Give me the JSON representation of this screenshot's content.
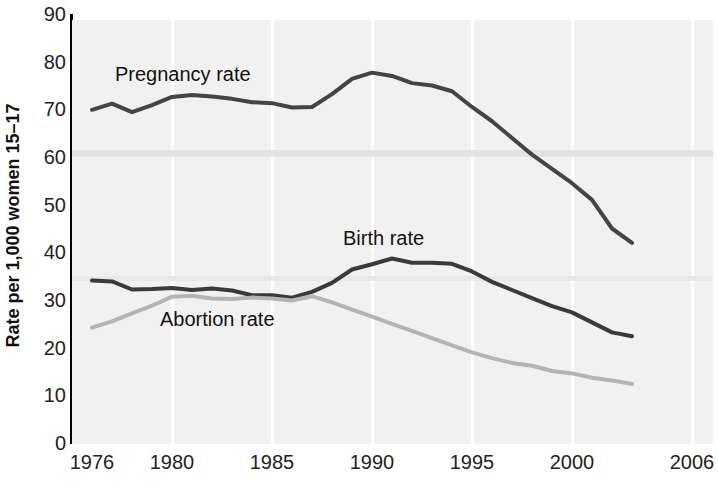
{
  "chart_data": {
    "type": "line",
    "title": "",
    "subtitle": "",
    "xlabel": "",
    "ylabel": "Rate per 1,000 women 15–17",
    "xlim": [
      1976,
      2006
    ],
    "ylim": [
      0,
      90
    ],
    "grid": "vertical-white-gridlines-at-x-ticks",
    "legend": "inline-labels-on-plot",
    "x_tick_labels": [
      "1976",
      "1980",
      "1985",
      "1990",
      "1995",
      "2000",
      "2006"
    ],
    "x_tick_values": [
      1976,
      1980,
      1985,
      1990,
      1995,
      2000,
      2006
    ],
    "y_tick_labels": [
      "0",
      "10",
      "20",
      "30",
      "40",
      "50",
      "60",
      "70",
      "80",
      "90"
    ],
    "y_tick_values": [
      0,
      10,
      20,
      30,
      40,
      50,
      60,
      70,
      80,
      90
    ],
    "x": [
      1976,
      1977,
      1978,
      1979,
      1980,
      1981,
      1982,
      1983,
      1984,
      1985,
      1986,
      1987,
      1988,
      1989,
      1990,
      1991,
      1992,
      1993,
      1994,
      1995,
      1996,
      1997,
      1998,
      1999,
      2000,
      2001,
      2002,
      2003
    ],
    "series": [
      {
        "name": "Pregnancy rate",
        "color": "#444444",
        "values": [
          69.9,
          71.2,
          69.4,
          70.9,
          72.6,
          73.0,
          72.7,
          72.2,
          71.5,
          71.3,
          70.4,
          70.5,
          73.2,
          76.4,
          77.7,
          77.0,
          75.5,
          75.0,
          73.8,
          70.5,
          67.5,
          64.0,
          60.5,
          57.5,
          54.5,
          51.0,
          45.0,
          42.0
        ],
        "label_position": {
          "x": 115,
          "y": 64
        }
      },
      {
        "name": "Birth rate",
        "color": "#3a3a3a",
        "values": [
          34.1,
          33.9,
          32.2,
          32.3,
          32.5,
          32.1,
          32.4,
          32.0,
          31.0,
          31.0,
          30.5,
          31.7,
          33.6,
          36.4,
          37.5,
          38.7,
          37.8,
          37.8,
          37.6,
          36.0,
          33.8,
          32.1,
          30.4,
          28.7,
          27.4,
          25.3,
          23.2,
          22.4
        ],
        "label_position": {
          "x": 343,
          "y": 228
        }
      },
      {
        "name": "Abortion rate",
        "color": "#b4b4b4",
        "values": [
          24.2,
          25.5,
          27.2,
          28.8,
          30.7,
          30.9,
          30.3,
          30.2,
          30.5,
          30.3,
          29.9,
          30.8,
          29.5,
          28.0,
          26.5,
          25.0,
          23.5,
          22.0,
          20.5,
          19.0,
          17.8,
          16.8,
          16.2,
          15.1,
          14.6,
          13.7,
          13.1,
          12.4
        ],
        "label_position": {
          "x": 160,
          "y": 309
        }
      }
    ]
  }
}
